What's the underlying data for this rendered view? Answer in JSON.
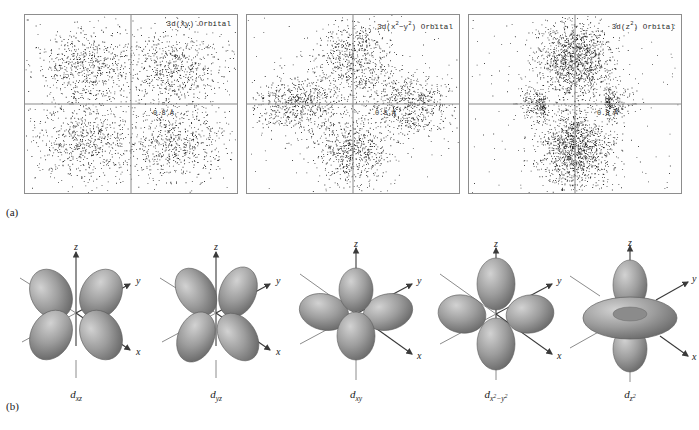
{
  "figure": {
    "panel_a_label": "(a)",
    "panel_b_label": "(b)"
  },
  "panel_a": {
    "plots": [
      {
        "title_prefix": "3d(xy) Orbital",
        "orbital": "3d(xy)",
        "scale_label": "0.8 Å",
        "lobe_pattern": "four-lobe-diagonal",
        "lobes": [
          {
            "cx": 0.29,
            "cy": 0.29
          },
          {
            "cx": 0.71,
            "cy": 0.29
          },
          {
            "cx": 0.29,
            "cy": 0.71
          },
          {
            "cx": 0.71,
            "cy": 0.71
          }
        ],
        "point_count": 2600,
        "spread": 0.115
      },
      {
        "title_prefix": "3d(x²-y²) Orbital",
        "orbital": "3d(x2-y2)",
        "scale_label": "0.8 Å",
        "lobe_pattern": "four-lobe-axial",
        "lobes": [
          {
            "cx": 0.5,
            "cy": 0.24
          },
          {
            "cx": 0.5,
            "cy": 0.76
          },
          {
            "cx": 0.24,
            "cy": 0.5
          },
          {
            "cx": 0.76,
            "cy": 0.5
          }
        ],
        "point_count": 2600,
        "spread": 0.105
      },
      {
        "title_prefix": "3d(z²) Orbital",
        "orbital": "3d(z2)",
        "scale_label": "0.8 Å",
        "lobe_pattern": "two-lobe-plus-torus",
        "lobes": [
          {
            "cx": 0.5,
            "cy": 0.25
          },
          {
            "cx": 0.5,
            "cy": 0.75
          }
        ],
        "point_count": 2600,
        "spread": 0.115
      }
    ],
    "axis_labels": {
      "vertical": "",
      "horizontal": ""
    }
  },
  "panel_b": {
    "axis_names": {
      "z": "z",
      "y": "y",
      "x": "x"
    },
    "orbitals": [
      {
        "name_base": "d",
        "sub": "xz",
        "shape": "cloverleaf-xz",
        "caption": "d"
      },
      {
        "name_base": "d",
        "sub": "yz",
        "shape": "cloverleaf-yz",
        "caption": "d"
      },
      {
        "name_base": "d",
        "sub": "xy",
        "shape": "cloverleaf-xy",
        "caption": "d"
      },
      {
        "name_base": "d",
        "sub": "x2-y2",
        "shape": "cloverleaf-axial",
        "caption": "d"
      },
      {
        "name_base": "d",
        "sub": "z2",
        "shape": "dumbbell-torus",
        "caption": "d"
      }
    ]
  },
  "colors": {
    "lobe_fill": "#9a9a9a",
    "lobe_highlight": "#cfcfcf",
    "lobe_shadow": "#6e6e6e",
    "axis": "#3a3a3a",
    "box_border": "#8d8d8d",
    "dot": "#1c1c1c",
    "background": "#ffffff"
  }
}
